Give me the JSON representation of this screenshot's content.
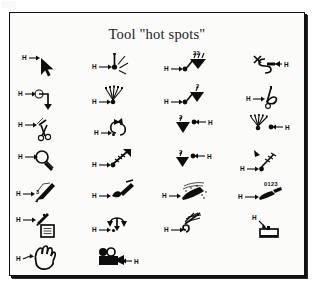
{
  "figure": {
    "title": "Tool \"hot spots\"",
    "frame_color": "#101010",
    "background_color": "#fbfbfa",
    "ink_color": "#0d0d0d",
    "columns": 4,
    "rows": 7,
    "hotspot_marker_label": "H"
  },
  "tools": [
    {
      "row": 1,
      "col": 1,
      "name": "arrow-pointer-tool",
      "icon": "arrow-pointer-icon",
      "hotspot_label": "H",
      "hotspot_side": "left",
      "extra_label": ""
    },
    {
      "row": 1,
      "col": 2,
      "name": "spray-burst-tool",
      "icon": "spray-burst-icon",
      "hotspot_label": "H",
      "hotspot_side": "left",
      "extra_label": ""
    },
    {
      "row": 1,
      "col": 3,
      "name": "funnel-double-tool",
      "icon": "funnel-double-icon",
      "hotspot_label": "H",
      "hotspot_side": "left",
      "extra_label": ""
    },
    {
      "row": 1,
      "col": 4,
      "name": "s-curve-tool",
      "icon": "s-curve-icon",
      "hotspot_label": "H",
      "hotspot_side": "right",
      "extra_label": ""
    },
    {
      "row": 2,
      "col": 1,
      "name": "bent-arrow-tool",
      "icon": "bent-arrow-icon",
      "hotspot_label": "H",
      "hotspot_side": "left",
      "extra_label": ""
    },
    {
      "row": 2,
      "col": 2,
      "name": "airbrush-rays-tool",
      "icon": "airbrush-rays-icon",
      "hotspot_label": "H",
      "hotspot_side": "left",
      "extra_label": ""
    },
    {
      "row": 2,
      "col": 3,
      "name": "funnel-single-tool",
      "icon": "funnel-single-icon",
      "hotspot_label": "H",
      "hotspot_side": "left",
      "extra_label": ""
    },
    {
      "row": 2,
      "col": 4,
      "name": "scissors-cut-tool",
      "icon": "scissors-icon",
      "hotspot_label": "H",
      "hotspot_side": "left",
      "extra_label": ""
    },
    {
      "row": 3,
      "col": 1,
      "name": "scissors-trim-tool",
      "icon": "scissors-small-icon",
      "hotspot_label": "H",
      "hotspot_side": "left",
      "extra_label": ""
    },
    {
      "row": 3,
      "col": 2,
      "name": "rotate-arrows-tool",
      "icon": "rotate-arrows-icon",
      "hotspot_label": "H",
      "hotspot_side": "left",
      "extra_label": ""
    },
    {
      "row": 3,
      "col": 3,
      "name": "funnel-right-tool",
      "icon": "funnel-right-icon",
      "hotspot_label": "H",
      "hotspot_side": "right",
      "extra_label": ""
    },
    {
      "row": 3,
      "col": 4,
      "name": "airbrush-right-tool",
      "icon": "airbrush-right-icon",
      "hotspot_label": "H",
      "hotspot_side": "right",
      "extra_label": ""
    },
    {
      "row": 4,
      "col": 1,
      "name": "magnifier-zoom-tool",
      "icon": "magnifier-icon",
      "hotspot_label": "H",
      "hotspot_side": "left",
      "extra_label": ""
    },
    {
      "row": 4,
      "col": 2,
      "name": "rays-arrow-tool",
      "icon": "rays-arrow-icon",
      "hotspot_label": "H",
      "hotspot_side": "left",
      "extra_label": ""
    },
    {
      "row": 4,
      "col": 3,
      "name": "funnel-right-small-tool",
      "icon": "funnel-right-small-icon",
      "hotspot_label": "H",
      "hotspot_side": "right",
      "extra_label": ""
    },
    {
      "row": 4,
      "col": 4,
      "name": "rays-down-tool",
      "icon": "rays-down-icon",
      "hotspot_label": "H",
      "hotspot_side": "left",
      "extra_label": ""
    },
    {
      "row": 5,
      "col": 1,
      "name": "pencil-draw-tool",
      "icon": "pencil-icon",
      "hotspot_label": "H",
      "hotspot_side": "left",
      "extra_label": ""
    },
    {
      "row": 5,
      "col": 2,
      "name": "paintbrush-tool",
      "icon": "paintbrush-icon",
      "hotspot_label": "H",
      "hotspot_side": "left",
      "extra_label": ""
    },
    {
      "row": 5,
      "col": 3,
      "name": "spray-can-tool",
      "icon": "spray-can-icon",
      "hotspot_label": "H",
      "hotspot_side": "left",
      "extra_label": ""
    },
    {
      "row": 5,
      "col": 4,
      "name": "measure-number-tool",
      "icon": "measure-pen-icon",
      "hotspot_label": "H",
      "hotspot_side": "left",
      "extra_label": "0123"
    },
    {
      "row": 6,
      "col": 1,
      "name": "pencil-note-tool",
      "icon": "pencil-note-icon",
      "hotspot_label": "H",
      "hotspot_side": "left",
      "extra_label": ""
    },
    {
      "row": 6,
      "col": 2,
      "name": "flip-vertical-tool",
      "icon": "flip-vertical-icon",
      "hotspot_label": "H",
      "hotspot_side": "left",
      "extra_label": ""
    },
    {
      "row": 6,
      "col": 3,
      "name": "rays-hook-tool",
      "icon": "rays-hook-icon",
      "hotspot_label": "H",
      "hotspot_side": "left",
      "extra_label": ""
    },
    {
      "row": 6,
      "col": 4,
      "name": "stamp-tool",
      "icon": "stamp-icon",
      "hotspot_label": "H",
      "hotspot_side": "left",
      "extra_label": ""
    },
    {
      "row": 7,
      "col": 1,
      "name": "hand-pan-tool",
      "icon": "hand-icon",
      "hotspot_label": "H",
      "hotspot_side": "left",
      "extra_label": ""
    },
    {
      "row": 7,
      "col": 2,
      "name": "movie-camera-tool",
      "icon": "movie-camera-icon",
      "hotspot_label": "H",
      "hotspot_side": "right",
      "extra_label": ""
    }
  ]
}
